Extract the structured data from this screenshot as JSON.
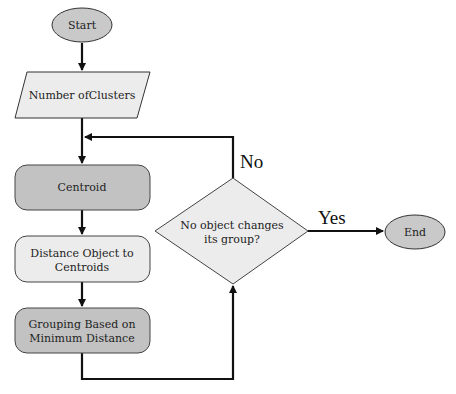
{
  "diagram": {
    "type": "flowchart",
    "colors": {
      "terminal_fill": "#c9c9c9",
      "process_dark_fill": "#c2c2c2",
      "process_light_fill": "#ececec",
      "stroke": "#111111"
    },
    "nodes": {
      "start": {
        "label": "Start",
        "shape": "ellipse"
      },
      "clusters": {
        "label": "Number ofClusters",
        "shape": "parallelogram"
      },
      "centroid": {
        "label": "Centroid",
        "shape": "rounded-rect"
      },
      "distance": {
        "line1": "Distance Object to",
        "line2": "Centroids",
        "shape": "rounded-rect"
      },
      "grouping": {
        "line1": "Grouping Based on",
        "line2": "Minimum Distance",
        "shape": "rounded-rect"
      },
      "decision": {
        "line1": "No object changes",
        "line2": "its group?",
        "shape": "diamond"
      },
      "end": {
        "label": "End",
        "shape": "ellipse"
      }
    },
    "edges": [
      {
        "from": "start",
        "to": "clusters",
        "label": ""
      },
      {
        "from": "clusters",
        "to": "centroid",
        "label": ""
      },
      {
        "from": "centroid",
        "to": "distance",
        "label": ""
      },
      {
        "from": "distance",
        "to": "grouping",
        "label": ""
      },
      {
        "from": "grouping",
        "to": "decision",
        "label": ""
      },
      {
        "from": "decision",
        "to": "centroid",
        "label": "No"
      },
      {
        "from": "decision",
        "to": "end",
        "label": "Yes"
      }
    ],
    "edge_labels": {
      "no": "No",
      "yes": "Yes"
    }
  }
}
